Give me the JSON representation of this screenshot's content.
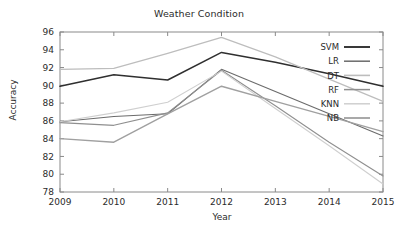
{
  "chart_data": {
    "type": "line",
    "title": "Weather Condition",
    "xlabel": "Year",
    "ylabel": "Accuracy",
    "x": [
      2009,
      2010,
      2011,
      2012,
      2013,
      2014,
      2015
    ],
    "xticklabels": [
      "2009",
      "2010",
      "2011",
      "2012",
      "2013",
      "2014",
      "2015"
    ],
    "yticklabels": [
      "78",
      "80",
      "82",
      "84",
      "86",
      "88",
      "90",
      "92",
      "94",
      "96"
    ],
    "yticks": [
      78,
      80,
      82,
      84,
      86,
      88,
      90,
      92,
      94,
      96
    ],
    "xlim": [
      2009,
      2015
    ],
    "ylim": [
      78,
      96
    ],
    "grid": false,
    "legend_position": "upper right",
    "series": [
      {
        "name": "SVM",
        "color": "#2f2f2f",
        "width": 1.5,
        "values": [
          89.9,
          91.2,
          90.6,
          93.7,
          92.6,
          91.3,
          89.9
        ]
      },
      {
        "name": "LR",
        "color": "#6b6b6b",
        "width": 1.1,
        "values": [
          85.9,
          86.5,
          86.8,
          91.8,
          89.3,
          86.8,
          84.3
        ]
      },
      {
        "name": "DT",
        "color": "#bdbdbd",
        "width": 1.2,
        "values": [
          91.8,
          91.9,
          93.6,
          95.4,
          93.2,
          90.7,
          88.2
        ]
      },
      {
        "name": "RF",
        "color": "#8f8f8f",
        "width": 1.1,
        "values": [
          85.8,
          85.5,
          86.9,
          91.7,
          87.7,
          83.6,
          79.8
        ]
      },
      {
        "name": "KNN",
        "color": "#cfcfcf",
        "width": 1.1,
        "values": [
          85.9,
          86.9,
          88.1,
          91.6,
          87.4,
          83.2,
          78.9
        ]
      },
      {
        "name": "NB",
        "color": "#a0a0a0",
        "width": 1.4,
        "values": [
          84.0,
          83.6,
          86.8,
          89.9,
          88.2,
          86.5,
          84.8
        ]
      }
    ]
  },
  "axes": {
    "frame_color": "#8a8a8a"
  }
}
